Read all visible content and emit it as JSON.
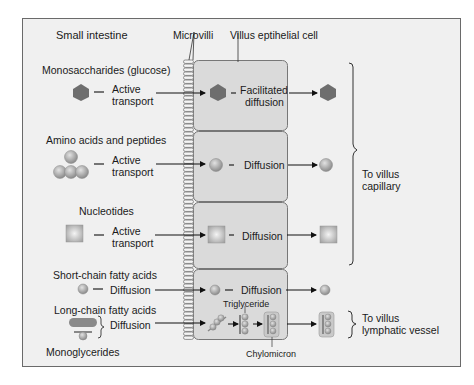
{
  "diagram": {
    "title": "Small intestine",
    "labels": {
      "microvilli": "Microvilli",
      "villus_cell": "Villus eptihelial cell",
      "triglyceride": "Triglyceride",
      "chylomicron": "Chylomicron",
      "monoglycerides": "Monoglycerides"
    },
    "rows": [
      {
        "nutrient": "Monosaccharides (glucose)",
        "entry": [
          "Active",
          "transport"
        ],
        "intracellular": [
          "Facilitated",
          "diffusion"
        ],
        "shape": "hexagon"
      },
      {
        "nutrient": "Amino acids and peptides",
        "entry": [
          "Active",
          "transport"
        ],
        "intracellular": [
          "Diffusion"
        ],
        "shape": "circle"
      },
      {
        "nutrient": "Nucleotides",
        "entry": [
          "Active",
          "transport"
        ],
        "intracellular": [
          "Diffusion"
        ],
        "shape": "square"
      },
      {
        "nutrient": "Short-chain fatty acids",
        "entry": [
          "Diffusion"
        ],
        "intracellular": [
          "Diffusion"
        ],
        "shape": "small-circle"
      },
      {
        "nutrient": "Long-chain fatty acids",
        "entry": [
          "Diffusion"
        ],
        "intracellular": [],
        "shape": "lipid"
      }
    ],
    "destinations": {
      "capillary": [
        "To villus",
        "capillary"
      ],
      "lymphatic": [
        "To villus",
        "lymphatic vessel"
      ]
    },
    "colors": {
      "background": "#efefef",
      "cell": "#dcdcdc",
      "border": "#6b6b6b",
      "hexagon": "#6e6e6e",
      "sphere": "#a8a8a8",
      "square": "#c4c4c4"
    }
  }
}
